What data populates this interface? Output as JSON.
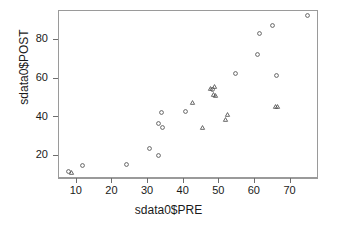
{
  "chart_data": {
    "type": "scatter",
    "title": "",
    "xlabel": "sdata0$PRE",
    "ylabel": "sdata0$POST",
    "xlim": [
      5,
      78
    ],
    "ylim": [
      8,
      95
    ],
    "xticks": [
      10,
      20,
      30,
      40,
      50,
      60,
      70
    ],
    "yticks": [
      20,
      40,
      60,
      80
    ],
    "grid": false,
    "legend": "none",
    "marker_color": "#4c4c4c",
    "frame_color": "#9a9a9a",
    "series": [
      {
        "name": "circle",
        "marker": "open-circle",
        "points": [
          [
            7.8,
            12.0
          ],
          [
            11.5,
            14.8
          ],
          [
            24.0,
            15.6
          ],
          [
            30.5,
            23.6
          ],
          [
            32.8,
            20.4
          ],
          [
            33.8,
            42.5
          ],
          [
            33.0,
            37.0
          ],
          [
            34.1,
            34.5
          ],
          [
            40.5,
            43.0
          ],
          [
            48.0,
            54.3
          ],
          [
            54.5,
            62.5
          ],
          [
            60.8,
            72.5
          ],
          [
            61.4,
            83.4
          ],
          [
            65.0,
            87.6
          ],
          [
            66.2,
            61.5
          ],
          [
            74.8,
            92.8
          ]
        ]
      },
      {
        "name": "triangle",
        "marker": "open-triangle",
        "points": [
          [
            8.6,
            11.6
          ],
          [
            42.5,
            47.5
          ],
          [
            45.2,
            34.5
          ],
          [
            47.6,
            54.8
          ],
          [
            48.6,
            55.9
          ],
          [
            48.4,
            52.0
          ],
          [
            49.0,
            51.4
          ],
          [
            51.8,
            38.8
          ],
          [
            52.3,
            41.3
          ],
          [
            65.9,
            45.6
          ],
          [
            66.4,
            45.4
          ]
        ]
      }
    ]
  }
}
